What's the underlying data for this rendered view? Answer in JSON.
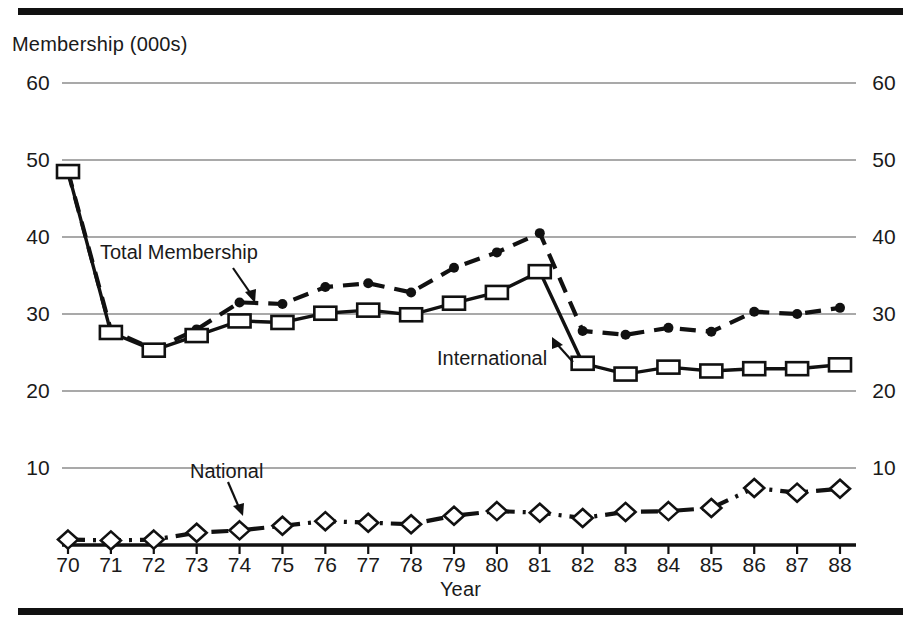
{
  "figure": {
    "y_axis_title": "Membership (000s)",
    "x_axis_title": "Year"
  },
  "annotations": {
    "total": "Total Membership",
    "international": "International",
    "national": "National"
  },
  "chart_data": {
    "type": "line",
    "title": "",
    "xlabel": "Year",
    "ylabel": "Membership (000s)",
    "ylim": [
      0,
      60
    ],
    "yticks": [
      10,
      20,
      30,
      40,
      50,
      60
    ],
    "ytick_labels_left": [
      "10",
      "20",
      "30",
      "40",
      "50",
      "60"
    ],
    "ytick_labels_right": [
      "10",
      "20",
      "30",
      "40",
      "50",
      "60"
    ],
    "grid": true,
    "legend": "inline-annotations",
    "categories": [
      "70",
      "71",
      "72",
      "73",
      "74",
      "75",
      "76",
      "77",
      "78",
      "79",
      "80",
      "81",
      "82",
      "83",
      "84",
      "85",
      "86",
      "87",
      "88"
    ],
    "x": [
      1970,
      1971,
      1972,
      1973,
      1974,
      1975,
      1976,
      1977,
      1978,
      1979,
      1980,
      1981,
      1982,
      1983,
      1984,
      1985,
      1986,
      1987,
      1988
    ],
    "series": [
      {
        "name": "Total Membership",
        "marker": "filled-circle",
        "linestyle": "dashed",
        "values": [
          48.5,
          27.9,
          25.4,
          28.0,
          31.5,
          31.3,
          33.5,
          34.0,
          32.8,
          36.0,
          38.0,
          40.5,
          27.8,
          27.3,
          28.2,
          27.7,
          30.3,
          30.0,
          30.8
        ]
      },
      {
        "name": "International",
        "marker": "open-square",
        "linestyle": "solid",
        "values": [
          48.5,
          27.6,
          25.3,
          27.2,
          29.1,
          28.9,
          30.1,
          30.5,
          29.9,
          31.4,
          32.8,
          35.5,
          23.6,
          22.2,
          23.1,
          22.6,
          22.9,
          22.9,
          23.4
        ]
      },
      {
        "name": "National",
        "marker": "open-diamond",
        "linestyle": "dash-dot",
        "values": [
          0.7,
          0.6,
          0.7,
          1.6,
          1.9,
          2.5,
          3.1,
          2.9,
          2.7,
          3.8,
          4.4,
          4.2,
          3.5,
          4.3,
          4.4,
          4.8,
          7.4,
          6.8,
          7.3
        ]
      }
    ]
  }
}
